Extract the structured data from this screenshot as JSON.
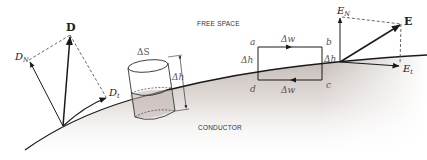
{
  "diagram": {
    "regions": {
      "upper": "FREE SPACE",
      "lower": "CONDUCTOR"
    },
    "d_field": {
      "vector": "D",
      "normal_component": "D",
      "normal_sub": "N",
      "tangential_component": "D",
      "tangential_sub": "t"
    },
    "e_field": {
      "vector": "E",
      "normal_component": "E",
      "normal_sub": "N",
      "tangential_component": "E",
      "tangential_sub": "t"
    },
    "gaussian_cylinder": {
      "surface_label": "ΔS",
      "height_label": "Δh"
    },
    "closed_path": {
      "corners": [
        "a",
        "b",
        "c",
        "d"
      ],
      "top_width_label": "Δw",
      "bottom_width_label": "Δw",
      "left_height_label": "Δh",
      "right_height_label": "Δh"
    },
    "colors": {
      "conductor_shade": "#c9bfba",
      "line": "#1a1a1a",
      "dashed": "#444444"
    }
  }
}
